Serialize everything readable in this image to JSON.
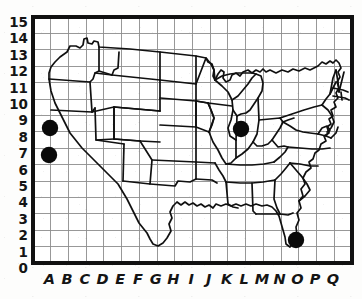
{
  "chart_data": {
    "type": "scatter",
    "title": "",
    "subtitle": "",
    "xlabel": "",
    "ylabel": "",
    "grid": true,
    "background_image": "us-states-outline-map",
    "x_categories": [
      "A",
      "B",
      "C",
      "D",
      "E",
      "F",
      "G",
      "H",
      "I",
      "J",
      "K",
      "L",
      "M",
      "N",
      "O",
      "P",
      "Q"
    ],
    "y_ticks": [
      "0",
      "1",
      "2",
      "3",
      "4",
      "5",
      "6",
      "7",
      "8",
      "9",
      "10",
      "11",
      "12",
      "13",
      "14",
      "15"
    ],
    "xlim": [
      0,
      17
    ],
    "ylim": [
      0,
      15
    ],
    "marker_style": "filled-circle",
    "marker_color": "#0a0a0a",
    "points": [
      {
        "label": "A9",
        "x": "A",
        "y": 9,
        "px": 50,
        "py": 128
      },
      {
        "label": "A7",
        "x": "A",
        "y": 7,
        "px": 49,
        "py": 155
      },
      {
        "label": "L9",
        "x": "L",
        "y": 9,
        "px": 241,
        "py": 129
      },
      {
        "label": "O2",
        "x": "O",
        "y": 2,
        "px": 296,
        "py": 240
      }
    ],
    "series": [
      {
        "name": "Marked locations",
        "values": [
          {
            "x": "A",
            "y": 9
          },
          {
            "x": "A",
            "y": 7
          },
          {
            "x": "L",
            "y": 9
          },
          {
            "x": "O",
            "y": 2
          }
        ]
      }
    ],
    "legend": [],
    "legend_position": "none",
    "annotations": []
  },
  "axes": {
    "y_labels": [
      "15",
      "14",
      "13",
      "12",
      "11",
      "10",
      "9",
      "8",
      "7",
      "6",
      "5",
      "4",
      "3",
      "2",
      "1",
      "0"
    ],
    "x_labels": [
      "A",
      "B",
      "C",
      "D",
      "E",
      "F",
      "G",
      "H",
      "I",
      "J",
      "K",
      "L",
      "M",
      "N",
      "O",
      "P",
      "Q"
    ]
  },
  "colors": {
    "frame": "#111111",
    "grid": "#8d8d8d",
    "map_outline": "#101010",
    "marker": "#0a0a0a",
    "paper": "#fdfdfc"
  }
}
